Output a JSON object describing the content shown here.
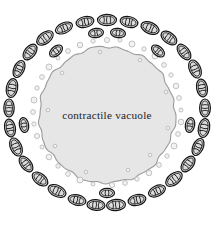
{
  "figure": {
    "kind": "biological-cell-diagram",
    "width": 214,
    "height": 230,
    "background_color": "#ffffff"
  },
  "vacuole": {
    "label": "contractile vacuole",
    "fill_color": "#e6e6e6",
    "outline_color": "#9a9a9a",
    "outline_width": 1.1,
    "center_x": 107,
    "center_y": 115,
    "radius": 68,
    "edge_style": "scalloped",
    "label_x": 107,
    "label_y": 116,
    "label_color": "#1d1d1d",
    "label_font_size": 11.2
  },
  "vesicles": {
    "name": "small vesicles",
    "fill_color": "#f2f2f2",
    "outline_color": "#b4b4b4",
    "outline_width": 0.8,
    "count": 46,
    "items": [
      {
        "x": 107,
        "y": 40,
        "r": 2.6
      },
      {
        "x": 120,
        "y": 40,
        "r": 2.0
      },
      {
        "x": 93,
        "y": 41,
        "r": 2.2
      },
      {
        "x": 132,
        "y": 44,
        "r": 3.0
      },
      {
        "x": 80,
        "y": 45,
        "r": 2.8
      },
      {
        "x": 144,
        "y": 49,
        "r": 2.2
      },
      {
        "x": 68,
        "y": 51,
        "r": 2.4
      },
      {
        "x": 155,
        "y": 56,
        "r": 3.0
      },
      {
        "x": 58,
        "y": 58,
        "r": 2.0
      },
      {
        "x": 164,
        "y": 65,
        "r": 2.4
      },
      {
        "x": 49,
        "y": 67,
        "r": 3.0
      },
      {
        "x": 171,
        "y": 75,
        "r": 2.2
      },
      {
        "x": 42,
        "y": 77,
        "r": 2.4
      },
      {
        "x": 176,
        "y": 86,
        "r": 2.8
      },
      {
        "x": 37,
        "y": 88,
        "r": 2.2
      },
      {
        "x": 179,
        "y": 98,
        "r": 2.4
      },
      {
        "x": 34,
        "y": 100,
        "r": 3.0
      },
      {
        "x": 181,
        "y": 110,
        "r": 2.0
      },
      {
        "x": 33,
        "y": 112,
        "r": 2.4
      },
      {
        "x": 181,
        "y": 122,
        "r": 2.8
      },
      {
        "x": 34,
        "y": 124,
        "r": 2.2
      },
      {
        "x": 178,
        "y": 134,
        "r": 2.4
      },
      {
        "x": 37,
        "y": 136,
        "r": 2.6
      },
      {
        "x": 174,
        "y": 146,
        "r": 3.0
      },
      {
        "x": 42,
        "y": 147,
        "r": 2.0
      },
      {
        "x": 167,
        "y": 156,
        "r": 2.2
      },
      {
        "x": 49,
        "y": 157,
        "r": 2.8
      },
      {
        "x": 159,
        "y": 165,
        "r": 2.4
      },
      {
        "x": 58,
        "y": 166,
        "r": 2.2
      },
      {
        "x": 149,
        "y": 173,
        "r": 2.8
      },
      {
        "x": 68,
        "y": 174,
        "r": 2.4
      },
      {
        "x": 137,
        "y": 179,
        "r": 2.2
      },
      {
        "x": 80,
        "y": 180,
        "r": 3.0
      },
      {
        "x": 125,
        "y": 183,
        "r": 2.4
      },
      {
        "x": 93,
        "y": 184,
        "r": 2.0
      },
      {
        "x": 112,
        "y": 185,
        "r": 2.6
      },
      {
        "x": 100,
        "y": 52,
        "r": 1.8
      },
      {
        "x": 140,
        "y": 60,
        "r": 1.8
      },
      {
        "x": 62,
        "y": 73,
        "r": 1.8
      },
      {
        "x": 166,
        "y": 92,
        "r": 1.8
      },
      {
        "x": 48,
        "y": 110,
        "r": 1.8
      },
      {
        "x": 168,
        "y": 128,
        "r": 1.8
      },
      {
        "x": 55,
        "y": 146,
        "r": 1.8
      },
      {
        "x": 150,
        "y": 155,
        "r": 1.8
      },
      {
        "x": 86,
        "y": 172,
        "r": 1.8
      },
      {
        "x": 128,
        "y": 170,
        "r": 1.8
      }
    ]
  },
  "mitochondria": {
    "name": "mitochondria",
    "fill_color": "#dcdcdc",
    "outline_color": "#141414",
    "outline_width": 1.2,
    "cristae_color": "#141414",
    "count": 36,
    "items": [
      {
        "x": 107,
        "y": 20,
        "rx": 9.5,
        "ry": 5.6,
        "angle": 0
      },
      {
        "x": 129,
        "y": 22,
        "rx": 9.0,
        "ry": 5.4,
        "angle": 12
      },
      {
        "x": 85,
        "y": 22,
        "rx": 9.0,
        "ry": 5.4,
        "angle": -12
      },
      {
        "x": 150,
        "y": 28,
        "rx": 9.5,
        "ry": 5.6,
        "angle": 24
      },
      {
        "x": 64,
        "y": 28,
        "rx": 9.0,
        "ry": 5.2,
        "angle": -24
      },
      {
        "x": 169,
        "y": 38,
        "rx": 9.0,
        "ry": 5.4,
        "angle": 37
      },
      {
        "x": 45,
        "y": 38,
        "rx": 9.5,
        "ry": 5.6,
        "angle": -37
      },
      {
        "x": 184,
        "y": 52,
        "rx": 9.0,
        "ry": 5.2,
        "angle": 52
      },
      {
        "x": 30,
        "y": 52,
        "rx": 9.0,
        "ry": 5.4,
        "angle": -52
      },
      {
        "x": 195,
        "y": 69,
        "rx": 9.5,
        "ry": 5.6,
        "angle": 66
      },
      {
        "x": 19,
        "y": 69,
        "rx": 9.0,
        "ry": 5.2,
        "angle": -66
      },
      {
        "x": 202,
        "y": 88,
        "rx": 9.0,
        "ry": 5.4,
        "angle": 79
      },
      {
        "x": 12,
        "y": 88,
        "rx": 9.5,
        "ry": 5.6,
        "angle": -79
      },
      {
        "x": 205,
        "y": 108,
        "rx": 9.0,
        "ry": 5.4,
        "angle": 90
      },
      {
        "x": 9,
        "y": 108,
        "rx": 9.0,
        "ry": 5.2,
        "angle": 90
      },
      {
        "x": 204,
        "y": 128,
        "rx": 9.5,
        "ry": 5.6,
        "angle": 101
      },
      {
        "x": 10,
        "y": 128,
        "rx": 9.0,
        "ry": 5.4,
        "angle": -101
      },
      {
        "x": 198,
        "y": 147,
        "rx": 9.0,
        "ry": 5.2,
        "angle": 114
      },
      {
        "x": 16,
        "y": 147,
        "rx": 9.5,
        "ry": 5.6,
        "angle": -114
      },
      {
        "x": 188,
        "y": 164,
        "rx": 9.0,
        "ry": 5.4,
        "angle": 128
      },
      {
        "x": 26,
        "y": 164,
        "rx": 9.0,
        "ry": 5.2,
        "angle": -128
      },
      {
        "x": 174,
        "y": 179,
        "rx": 9.5,
        "ry": 5.6,
        "angle": 142
      },
      {
        "x": 40,
        "y": 179,
        "rx": 9.0,
        "ry": 5.4,
        "angle": -142
      },
      {
        "x": 157,
        "y": 191,
        "rx": 9.0,
        "ry": 5.2,
        "angle": 155
      },
      {
        "x": 57,
        "y": 191,
        "rx": 9.5,
        "ry": 5.6,
        "angle": -155
      },
      {
        "x": 137,
        "y": 200,
        "rx": 9.0,
        "ry": 5.4,
        "angle": 167
      },
      {
        "x": 77,
        "y": 200,
        "rx": 9.0,
        "ry": 5.2,
        "angle": -167
      },
      {
        "x": 116,
        "y": 205,
        "rx": 9.5,
        "ry": 5.6,
        "angle": 176
      },
      {
        "x": 96,
        "y": 205,
        "rx": 9.0,
        "ry": 5.4,
        "angle": -176
      },
      {
        "x": 118,
        "y": 33,
        "rx": 7.5,
        "ry": 4.6,
        "angle": 8
      },
      {
        "x": 96,
        "y": 33,
        "rx": 7.5,
        "ry": 4.6,
        "angle": -8
      },
      {
        "x": 56,
        "y": 51,
        "rx": 7.5,
        "ry": 4.6,
        "angle": -40
      },
      {
        "x": 158,
        "y": 51,
        "rx": 7.5,
        "ry": 4.6,
        "angle": 40
      },
      {
        "x": 24,
        "y": 125,
        "rx": 7.5,
        "ry": 4.6,
        "angle": -100
      },
      {
        "x": 190,
        "y": 125,
        "rx": 7.5,
        "ry": 4.6,
        "angle": 100
      },
      {
        "x": 107,
        "y": 193,
        "rx": 7.5,
        "ry": 4.6,
        "angle": 180
      }
    ]
  }
}
